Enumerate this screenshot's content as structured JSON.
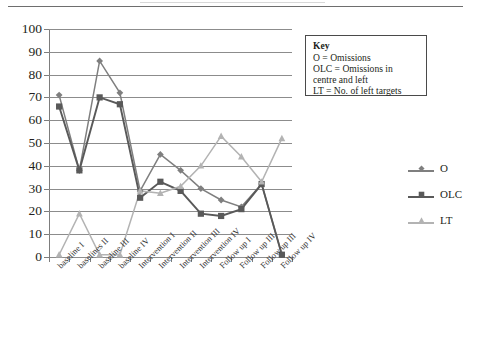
{
  "chart_data": {
    "type": "line",
    "title": "",
    "xlabel": "",
    "ylabel": "",
    "ylim": [
      0,
      100
    ],
    "yticks": [
      0,
      10,
      20,
      30,
      40,
      50,
      60,
      70,
      80,
      90,
      100
    ],
    "grid": true,
    "legend_position": "right",
    "categories": [
      "baseline I",
      "baselines II",
      "baseline III",
      "baseline IV",
      "Intervention I",
      "Intervention II",
      "Intervention III",
      "Intervention IV",
      "Follow up I",
      "Follow up III",
      "Follow up III",
      "Follow up IV"
    ],
    "series": [
      {
        "name": "O",
        "marker": "diamond",
        "color": "#7f7f7f",
        "values": [
          71,
          38,
          86,
          72,
          29,
          45,
          38,
          30,
          25,
          22,
          32,
          1
        ]
      },
      {
        "name": "OLC",
        "marker": "square",
        "color": "#595959",
        "values": [
          66,
          38,
          70,
          67,
          26,
          33,
          29,
          19,
          18,
          21,
          32,
          1
        ]
      },
      {
        "name": "LT",
        "marker": "triangle",
        "color": "#b3b3b3",
        "values": [
          1,
          19,
          1,
          1,
          29,
          28,
          31,
          40,
          53,
          44,
          33,
          52
        ]
      }
    ]
  },
  "key_box": {
    "title": "Key",
    "lines": [
      "O = Omissions",
      "OLC = Omissions in",
      "centre and left",
      "LT = No. of left targets"
    ]
  },
  "legend": {
    "entries": [
      {
        "label": "O"
      },
      {
        "label": "OLC"
      },
      {
        "label": "LT"
      }
    ]
  }
}
